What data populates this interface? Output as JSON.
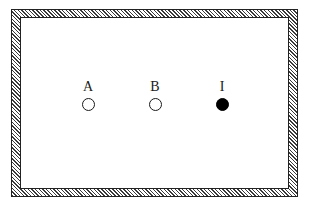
{
  "diagram": {
    "frame": {
      "style": "hatched-wall",
      "fill_color": "#ffffff",
      "hatch_color": "#3a3a3a"
    },
    "nodes": [
      {
        "label": "A",
        "filled": false,
        "color": "#ffffff"
      },
      {
        "label": "B",
        "filled": false,
        "color": "#ffffff"
      },
      {
        "label": "I",
        "filled": true,
        "color": "#000000"
      }
    ]
  }
}
